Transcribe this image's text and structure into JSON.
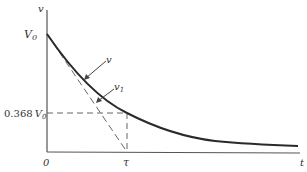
{
  "diagram": {
    "type": "exponential-decay",
    "axes": {
      "y_label": "v",
      "x_label": "t",
      "origin_label": "0"
    },
    "labels": {
      "v0": "V",
      "v0_sub": "0",
      "level": "0.368",
      "level_v": "V",
      "level_sub": "0",
      "tau": "τ",
      "curve_v": "v",
      "tangent_v": "v",
      "tangent_sub": "1"
    },
    "colors": {
      "curve": "#2a2a2a",
      "axis": "#555555",
      "dashed": "#666666",
      "text": "#333333"
    }
  }
}
